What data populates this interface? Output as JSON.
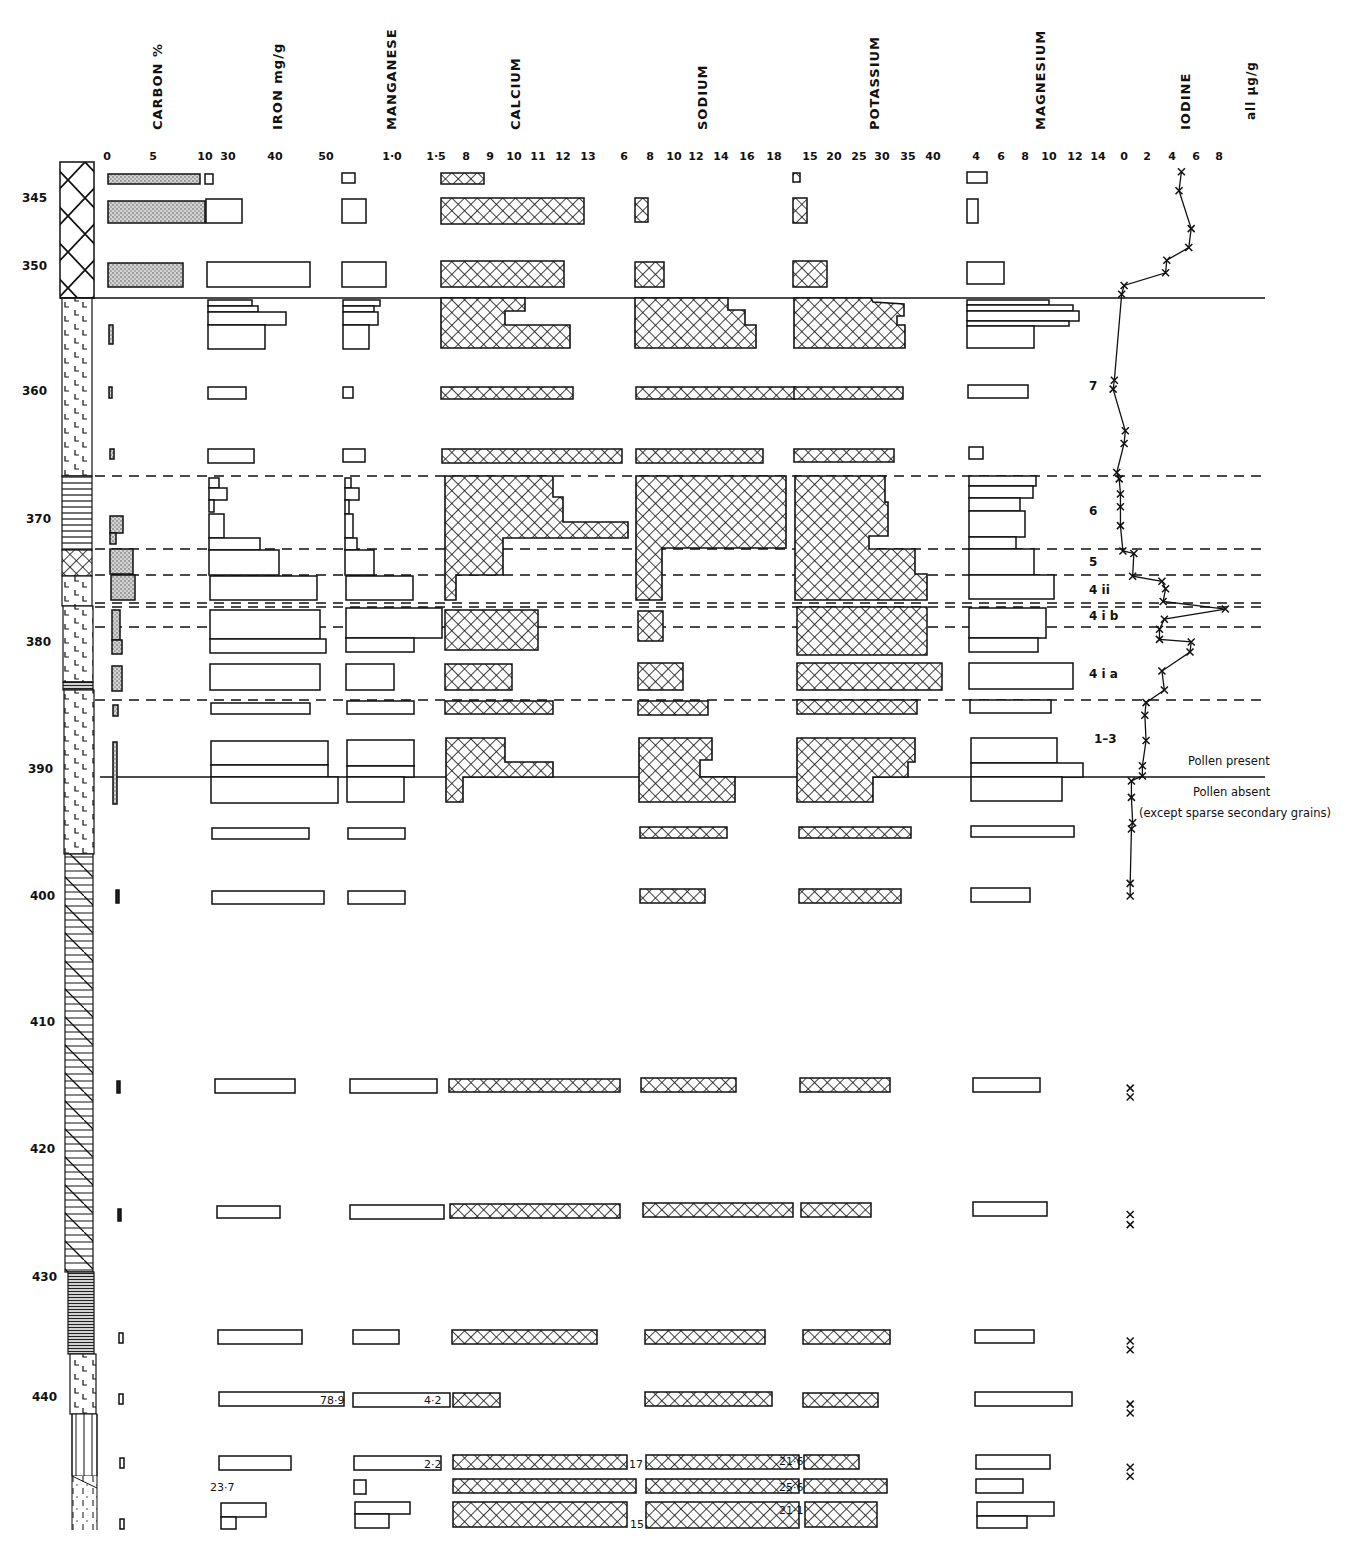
{
  "chart_data": {
    "type": "bar",
    "ylabel": "Depth (cm)",
    "depth_ticks": [
      345,
      350,
      360,
      370,
      380,
      390,
      400,
      410,
      420,
      430,
      440
    ],
    "units_note": "all μg/g",
    "columns": [
      {
        "name": "CARBON %",
        "ticks": [
          "0",
          "5",
          "10"
        ],
        "fill": "stipple"
      },
      {
        "name": "IRON mg/g",
        "ticks": [
          "30",
          "40",
          "50"
        ],
        "fill": "open"
      },
      {
        "name": "MANGANESE",
        "ticks": [
          "1·0",
          "1·5"
        ],
        "fill": "open"
      },
      {
        "name": "CALCIUM",
        "ticks": [
          "8",
          "9",
          "10",
          "11",
          "12",
          "13"
        ],
        "fill": "crosshatch"
      },
      {
        "name": "SODIUM",
        "ticks": [
          "6",
          "8",
          "10",
          "12",
          "14",
          "16",
          "18"
        ],
        "fill": "crosshatch"
      },
      {
        "name": "POTASSIUM",
        "ticks": [
          "15",
          "20",
          "25",
          "30",
          "35",
          "40"
        ],
        "fill": "crosshatch"
      },
      {
        "name": "MAGNESIUM",
        "ticks": [
          "4",
          "6",
          "8",
          "10",
          "12",
          "14"
        ],
        "fill": "open"
      },
      {
        "name": "IODINE",
        "ticks": [
          "0",
          "2",
          "4",
          "6",
          "8"
        ],
        "fill": "line"
      }
    ],
    "zones": [
      {
        "label": "7",
        "top": 348.5,
        "bottom": 367
      },
      {
        "label": "6",
        "top": 367,
        "bottom": 373
      },
      {
        "label": "5",
        "top": 373,
        "bottom": 375
      },
      {
        "label": "4 ii",
        "top": 375,
        "bottom": 377.2
      },
      {
        "label": "4 i b",
        "top": 377.2,
        "bottom": 379
      },
      {
        "label": "4 i a",
        "top": 379,
        "bottom": 385
      },
      {
        "label": "1–3",
        "top": 385,
        "bottom": 391
      }
    ],
    "pollen_boundary": {
      "depth": 391,
      "above": "Pollen present",
      "below": "Pollen absent",
      "below_note": "(except sparse secondary grains)"
    },
    "annotations": [
      "78·9",
      "4·2",
      "2·2",
      "17",
      "21·6",
      "23·7",
      "25·6",
      "15",
      "21·1"
    ],
    "iodine_profile": [
      [
        343,
        5.2
      ],
      [
        344.5,
        5.0
      ],
      [
        347.5,
        6.0
      ],
      [
        349,
        5.8
      ],
      [
        350,
        4.0
      ],
      [
        351,
        3.9
      ],
      [
        352,
        0.5
      ],
      [
        352.7,
        0.3
      ],
      [
        359.5,
        -0.3
      ],
      [
        360.2,
        -0.4
      ],
      [
        363.5,
        0.6
      ],
      [
        364.5,
        0.5
      ],
      [
        366.8,
        -0.1
      ],
      [
        367.3,
        0.1
      ],
      [
        368.5,
        0.2
      ],
      [
        369.5,
        0.2
      ],
      [
        371,
        0.2
      ],
      [
        373,
        0.4
      ],
      [
        373.2,
        1.3
      ],
      [
        375,
        1.2
      ],
      [
        375.4,
        3.6
      ],
      [
        376,
        3.9
      ],
      [
        377,
        3.7
      ],
      [
        377.6,
        8.8
      ],
      [
        378.4,
        3.8
      ],
      [
        379.2,
        3.4
      ],
      [
        380,
        3.4
      ],
      [
        380.2,
        6.0
      ],
      [
        381,
        5.9
      ],
      [
        382.5,
        3.6
      ],
      [
        384,
        3.8
      ],
      [
        385,
        2.3
      ],
      [
        386,
        2.2
      ],
      [
        388,
        2.3
      ],
      [
        390,
        2.0
      ],
      [
        390.8,
        2.0
      ],
      [
        391.2,
        1.1
      ],
      [
        392.5,
        1.1
      ],
      [
        394.5,
        1.2
      ],
      [
        395,
        1.1
      ],
      [
        399.3,
        1.0
      ],
      [
        400.3,
        1.0
      ]
    ],
    "iodine_isolated": [
      [
        415.5,
        1.0
      ],
      [
        416.2,
        1.0
      ],
      [
        425.5,
        1.0
      ],
      [
        426.3,
        1.0
      ],
      [
        435.5,
        1.0
      ],
      [
        436.2,
        1.0
      ],
      [
        440.5,
        1.0
      ],
      [
        441.2,
        1.0
      ],
      [
        445.5,
        1.0
      ],
      [
        446.2,
        1.0
      ]
    ]
  },
  "labels": {
    "carbon": "CARBON %",
    "iron": "IRON mg/g",
    "manganese": "MANGANESE",
    "calcium": "CALCIUM",
    "sodium": "SODIUM",
    "potassium": "POTASSIUM",
    "magnesium": "MAGNESIUM",
    "iodine": "IODINE",
    "units": "all μg/g",
    "pollen_present": "Pollen present",
    "pollen_absent": "Pollen absent",
    "pollen_note": "(except sparse secondary grains)"
  }
}
